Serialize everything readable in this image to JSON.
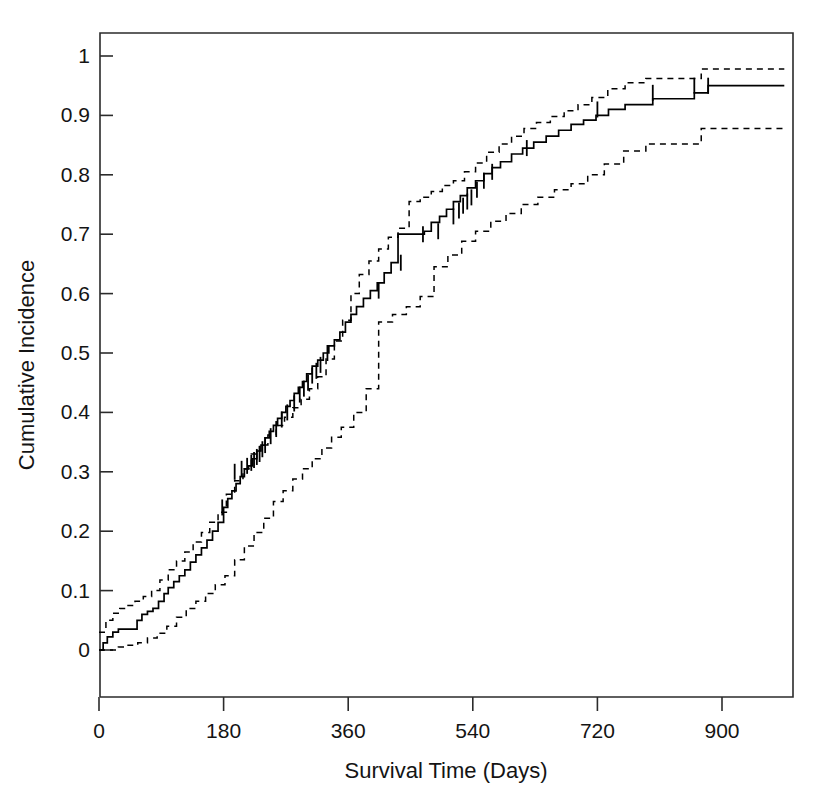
{
  "chart_data": {
    "type": "line",
    "title": "",
    "subtitle": "",
    "xlabel": "Survival Time (Days)",
    "ylabel": "Cumulative Incidence",
    "xlim": [
      0,
      1000
    ],
    "ylim": [
      0,
      1.04
    ],
    "grid": false,
    "legend": "none",
    "xticks": [
      0,
      180,
      360,
      540,
      720,
      900
    ],
    "xtick_labels": [
      "0",
      "180",
      "360",
      "540",
      "720",
      "900"
    ],
    "yticks": [
      0,
      0.1,
      0.2,
      0.3,
      0.4,
      0.5,
      0.6,
      0.7,
      0.8,
      0.9,
      1
    ],
    "ytick_labels": [
      "0",
      "0.1",
      "0.2",
      "0.3",
      "0.4",
      "0.5",
      "0.6",
      "0.7",
      "0.8",
      "0.9",
      "1"
    ],
    "line_styles": {
      "estimate": "solid",
      "confidence_band": "dashed"
    },
    "series": [
      {
        "name": "Cumulative Incidence (estimate)",
        "style": "solid",
        "step": true,
        "x": [
          0,
          6,
          12,
          20,
          28,
          34,
          40,
          48,
          55,
          62,
          70,
          78,
          86,
          94,
          100,
          108,
          116,
          124,
          132,
          140,
          148,
          156,
          164,
          172,
          180,
          186,
          192,
          198,
          204,
          210,
          216,
          222,
          228,
          234,
          240,
          246,
          252,
          258,
          264,
          270,
          276,
          282,
          288,
          294,
          300,
          308,
          316,
          324,
          332,
          340,
          348,
          356,
          364,
          372,
          382,
          392,
          402,
          412,
          422,
          432,
          470,
          480,
          492,
          502,
          512,
          522,
          532,
          544,
          556,
          568,
          580,
          596,
          612,
          628,
          646,
          664,
          682,
          700,
          718,
          736,
          760,
          800,
          860,
          880,
          990
        ],
        "y": [
          0.0,
          0.012,
          0.022,
          0.03,
          0.035,
          0.035,
          0.035,
          0.035,
          0.05,
          0.06,
          0.065,
          0.07,
          0.082,
          0.095,
          0.105,
          0.115,
          0.125,
          0.135,
          0.148,
          0.16,
          0.172,
          0.185,
          0.2,
          0.215,
          0.24,
          0.255,
          0.268,
          0.28,
          0.292,
          0.305,
          0.31,
          0.322,
          0.335,
          0.345,
          0.357,
          0.368,
          0.378,
          0.39,
          0.4,
          0.41,
          0.42,
          0.432,
          0.442,
          0.452,
          0.465,
          0.478,
          0.488,
          0.5,
          0.512,
          0.522,
          0.535,
          0.552,
          0.565,
          0.578,
          0.592,
          0.605,
          0.618,
          0.635,
          0.652,
          0.7,
          0.705,
          0.72,
          0.73,
          0.742,
          0.755,
          0.765,
          0.778,
          0.79,
          0.802,
          0.812,
          0.822,
          0.835,
          0.845,
          0.855,
          0.865,
          0.875,
          0.885,
          0.892,
          0.9,
          0.91,
          0.918,
          0.928,
          0.938,
          0.95,
          0.95
        ]
      },
      {
        "name": "Upper 95% confidence limit",
        "style": "dashed",
        "step": true,
        "x": [
          0,
          10,
          20,
          30,
          40,
          52,
          64,
          76,
          88,
          100,
          112,
          124,
          136,
          148,
          160,
          172,
          184,
          196,
          208,
          220,
          232,
          244,
          256,
          268,
          280,
          292,
          304,
          316,
          328,
          340,
          352,
          364,
          376,
          390,
          404,
          418,
          432,
          448,
          464,
          480,
          496,
          512,
          528,
          544,
          560,
          578,
          596,
          614,
          632,
          652,
          672,
          692,
          712,
          735,
          760,
          790,
          830,
          870,
          990
        ],
        "y": [
          0.03,
          0.05,
          0.062,
          0.07,
          0.075,
          0.082,
          0.09,
          0.1,
          0.118,
          0.135,
          0.15,
          0.165,
          0.182,
          0.198,
          0.215,
          0.232,
          0.262,
          0.285,
          0.305,
          0.33,
          0.345,
          0.362,
          0.378,
          0.392,
          0.408,
          0.422,
          0.44,
          0.46,
          0.49,
          0.52,
          0.555,
          0.6,
          0.632,
          0.655,
          0.675,
          0.695,
          0.71,
          0.755,
          0.762,
          0.772,
          0.782,
          0.79,
          0.805,
          0.82,
          0.838,
          0.852,
          0.865,
          0.878,
          0.888,
          0.898,
          0.908,
          0.918,
          0.93,
          0.945,
          0.955,
          0.962,
          0.962,
          0.978,
          0.978
        ]
      },
      {
        "name": "Lower 95% confidence limit",
        "style": "dashed",
        "step": true,
        "x": [
          0,
          14,
          28,
          42,
          56,
          70,
          84,
          98,
          112,
          126,
          140,
          154,
          168,
          182,
          196,
          210,
          224,
          238,
          252,
          266,
          280,
          294,
          308,
          322,
          336,
          350,
          368,
          386,
          404,
          424,
          444,
          464,
          484,
          504,
          524,
          544,
          566,
          588,
          610,
          634,
          658,
          682,
          706,
          730,
          758,
          790,
          830,
          870,
          990
        ],
        "y": [
          0.0,
          0.0,
          0.005,
          0.008,
          0.012,
          0.02,
          0.028,
          0.04,
          0.055,
          0.07,
          0.082,
          0.095,
          0.11,
          0.125,
          0.152,
          0.175,
          0.198,
          0.222,
          0.25,
          0.268,
          0.288,
          0.305,
          0.322,
          0.34,
          0.358,
          0.375,
          0.4,
          0.44,
          0.552,
          0.565,
          0.578,
          0.595,
          0.645,
          0.665,
          0.688,
          0.705,
          0.722,
          0.735,
          0.75,
          0.762,
          0.775,
          0.785,
          0.8,
          0.818,
          0.84,
          0.852,
          0.852,
          0.878,
          0.878
        ]
      }
    ],
    "censor_marks": {
      "name": "censored observations",
      "x": [
        178,
        196,
        206,
        214,
        220,
        224,
        228,
        232,
        236,
        240,
        248,
        256,
        264,
        272,
        282,
        290,
        296,
        302,
        308,
        314,
        320,
        330,
        404,
        436,
        468,
        490,
        512,
        520,
        526,
        532,
        538,
        546,
        556,
        568,
        618,
        720,
        800,
        860,
        880
      ],
      "y": [
        0.24,
        0.3,
        0.305,
        0.31,
        0.315,
        0.32,
        0.325,
        0.33,
        0.338,
        0.345,
        0.36,
        0.372,
        0.388,
        0.4,
        0.415,
        0.43,
        0.44,
        0.45,
        0.462,
        0.47,
        0.48,
        0.5,
        0.605,
        0.652,
        0.7,
        0.705,
        0.73,
        0.74,
        0.748,
        0.755,
        0.762,
        0.775,
        0.79,
        0.805,
        0.845,
        0.91,
        0.938,
        0.95,
        0.95
      ]
    }
  },
  "figure": {
    "background": "#ffffff",
    "foreground": "#000000"
  }
}
